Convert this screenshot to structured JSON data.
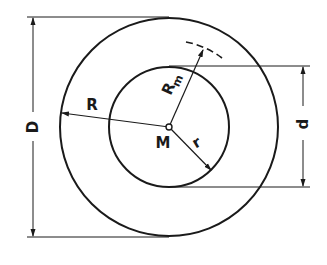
{
  "diagram": {
    "type": "annulus-dimension-drawing",
    "labels": {
      "outer_diameter": "D",
      "inner_diameter": "d",
      "outer_radius": "R",
      "inner_radius": "r",
      "mean_radius_main": "R",
      "mean_radius_sub": "m",
      "center": "M"
    },
    "colors": {
      "line": "#1a1a1a",
      "background": "#ffffff"
    }
  }
}
